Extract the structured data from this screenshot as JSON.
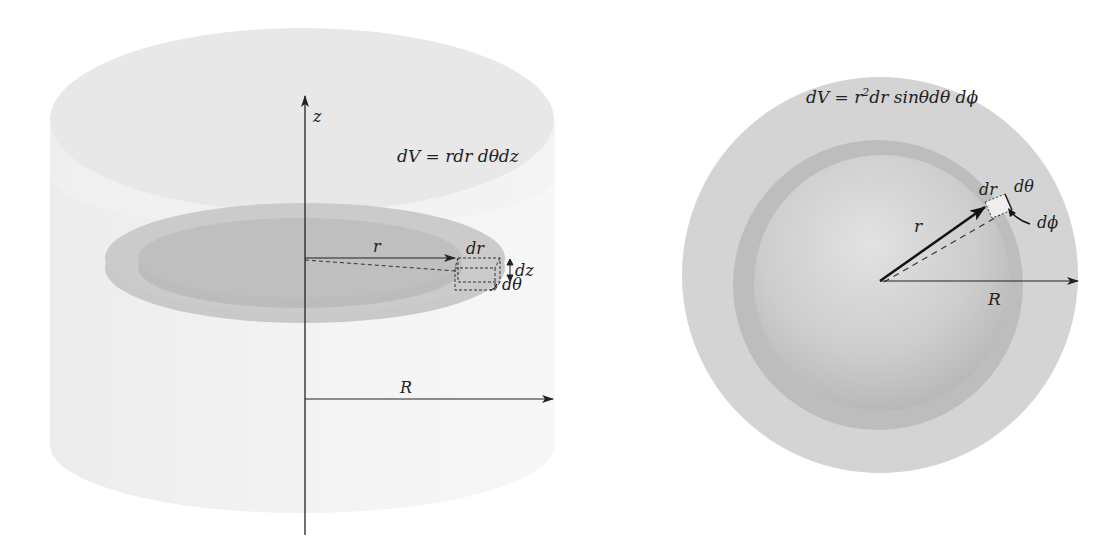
{
  "cylinder_panel": {
    "formula": "dV = rdr dθdz",
    "axis_label": "z",
    "inner_radius_label": "r",
    "outer_radius_label": "R",
    "element_labels": {
      "dr": "dr",
      "dtheta": "dθ",
      "dz": "dz"
    }
  },
  "sphere_panel": {
    "formula_prefix": "dV = r",
    "formula_exponent": "2",
    "formula_suffix": "dr sinθdθ dϕ",
    "inner_radius_label": "r",
    "outer_radius_label": "R",
    "element_labels": {
      "dr": "dr",
      "dtheta": "dθ",
      "dphi": "dϕ"
    }
  },
  "colors": {
    "background": "#ffffff",
    "cylinder_body": "#f0f0f0",
    "cylinder_top": "#e6e6e6",
    "disk_outer": "#c8c8c8",
    "disk_inner": "#b9b9b9",
    "sphere_outer": "#d2d2d2",
    "sphere_ring": "#bdbdbd",
    "sphere_core": "#cfcfcf",
    "line": "#222222"
  }
}
